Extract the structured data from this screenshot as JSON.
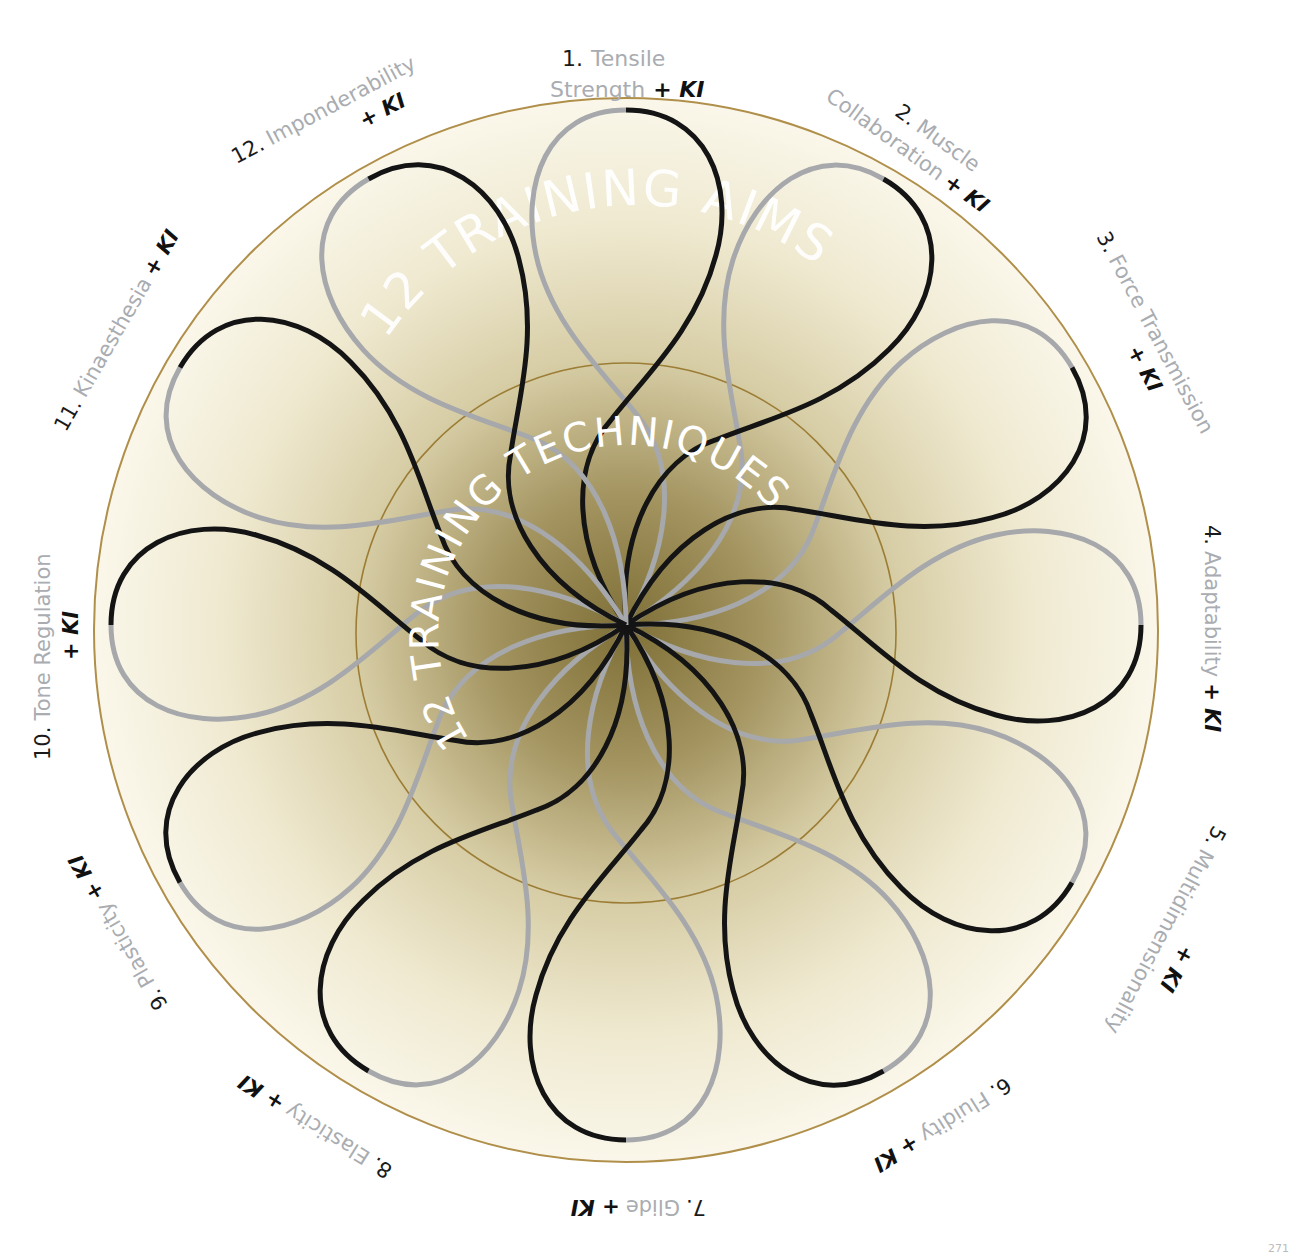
{
  "diagram": {
    "outer_ring_text": "12 TRAINING AIMS",
    "inner_ring_text": "12 TRAINING TECHNIQUES",
    "suffix": "+ KI",
    "aims": [
      {
        "num": "1.",
        "name_line1": "Tensile",
        "name_line2": "Strength",
        "ki": "+ KI"
      },
      {
        "num": "2.",
        "name_line1": "Muscle",
        "name_line2": "Collaboration",
        "ki": "+ KI"
      },
      {
        "num": "3.",
        "name_line1": "Force Transmission",
        "name_line2": "",
        "ki": "+ KI"
      },
      {
        "num": "4.",
        "name_line1": "Adaptability",
        "name_line2": "",
        "ki": "+ KI"
      },
      {
        "num": "5.",
        "name_line1": "Multidimensionality",
        "name_line2": "",
        "ki": "+ KI"
      },
      {
        "num": "6.",
        "name_line1": "Fluidity",
        "name_line2": "",
        "ki": "+ KI"
      },
      {
        "num": "7.",
        "name_line1": "Glide",
        "name_line2": "",
        "ki": "+ KI"
      },
      {
        "num": "8.",
        "name_line1": "Elasticity",
        "name_line2": "",
        "ki": "+ KI"
      },
      {
        "num": "9.",
        "name_line1": "Plasticity",
        "name_line2": "",
        "ki": "+ KI"
      },
      {
        "num": "10.",
        "name_line1": "Tone Regulation",
        "name_line2": "",
        "ki": "+ KI"
      },
      {
        "num": "11.",
        "name_line1": "Kinaesthesia",
        "name_line2": "",
        "ki": "+ KI"
      },
      {
        "num": "12.",
        "name_line1": "Imponderability",
        "name_line2": "",
        "ki": "+ KI"
      }
    ],
    "colors": {
      "loop_dark": "#141414",
      "loop_light": "#a6a8ab",
      "ring_stroke": "#b08f4a",
      "center_fill": "#8e7f45",
      "edge_fill": "#fbf8ec",
      "label_number": "#1a1a1a",
      "label_name": "#a9acb0"
    },
    "corner_mark": "271"
  }
}
